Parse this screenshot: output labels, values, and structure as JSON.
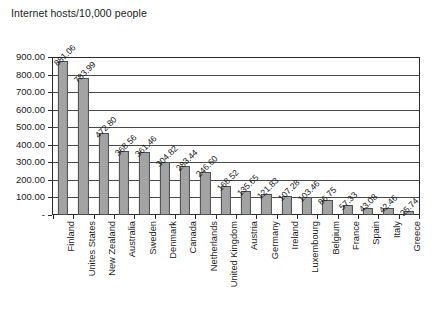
{
  "chart_data": {
    "type": "bar",
    "title": "Internet hosts/10,000 people",
    "xlabel": "",
    "ylabel": "",
    "ylim": [
      0,
      900
    ],
    "ytick_labels": [
      "900.00",
      "800.00",
      "700.00",
      "600.00",
      "500.00",
      "400.00",
      "300.00",
      "200.00",
      "100.00",
      "-"
    ],
    "ytick_values": [
      900,
      800,
      700,
      600,
      500,
      400,
      300,
      200,
      100,
      0
    ],
    "grid": true,
    "legend": false,
    "legend_position": "none",
    "bar_fill_color": "#a3a3a3",
    "bar_border_color": "#4f4f4f",
    "axis_color": "#2b2b2b",
    "categories": [
      "Finland",
      "Unites States",
      "New Zealand",
      "Australia",
      "Sweden",
      "Denmark",
      "Canada",
      "Netherlands",
      "United Kingdom",
      "Austria",
      "Germany",
      "Ireland",
      "Luxembourg",
      "Belgium",
      "France",
      "Spain",
      "Italy",
      "Greece"
    ],
    "values": [
      881.06,
      783.99,
      472.8,
      368.56,
      361.46,
      304.82,
      283.44,
      246.6,
      168.52,
      135.65,
      121.83,
      107.28,
      103.46,
      86.75,
      57.33,
      43.08,
      42.46,
      25.74
    ],
    "value_labels": [
      "881.06",
      "783.99",
      "472.80",
      "368.56",
      "361.46",
      "304.82",
      "283.44",
      "246.60",
      "168.52",
      "135.65",
      "121.83",
      "107.28",
      "103.46",
      "86.75",
      "57.33",
      "43.08",
      "42.46",
      "25.74"
    ]
  }
}
